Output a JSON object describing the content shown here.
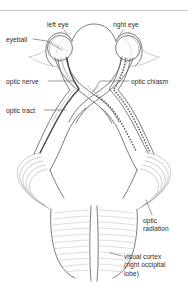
{
  "figure": {
    "domain": "Diagram",
    "width": 188,
    "height": 293,
    "background_color": "#ffffff",
    "line_color": "#5b5b5b",
    "faint_line_color": "#aeaeae",
    "text_color": "#2b2b2b",
    "top_rule_color": "#c9c9c9"
  },
  "labels": {
    "left_eye": "left eye",
    "right_eye": "right eye",
    "eyeball": "eyeball",
    "optic_nerve": "optic nerve",
    "optic_chiasm": "optic chiasm",
    "optic_tract": "optic tract",
    "optic_radiation_line1": "optic",
    "optic_radiation_line2": "radiation",
    "visual_cortex_line1": "visual cortex",
    "visual_cortex_line2": "(right occipital",
    "visual_cortex_line3": "lobe)"
  },
  "structures": [
    {
      "name": "left-eyeball",
      "label": "eyeball"
    },
    {
      "name": "right-eyeball",
      "label": "right eye"
    },
    {
      "name": "left-optic-nerve",
      "label": "optic nerve"
    },
    {
      "name": "right-optic-nerve",
      "label": "optic nerve"
    },
    {
      "name": "optic-chiasm",
      "label": "optic chiasm"
    },
    {
      "name": "left-optic-tract",
      "label": "optic tract"
    },
    {
      "name": "right-optic-tract",
      "label": "optic tract"
    },
    {
      "name": "left-optic-radiation",
      "label": "optic radiation"
    },
    {
      "name": "right-optic-radiation",
      "label": "optic radiation"
    },
    {
      "name": "occipital-lobes",
      "label": "visual cortex (right occipital lobe)"
    }
  ]
}
